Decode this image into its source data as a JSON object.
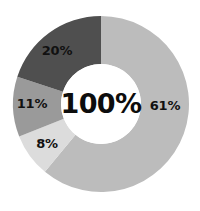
{
  "chart_data": {
    "type": "pie",
    "variant": "donut",
    "title": "",
    "subtitle": "",
    "xlabel": "",
    "ylabel": "",
    "legend": false,
    "legend_position": "none",
    "grid": false,
    "units": "percent",
    "start_angle_deg": 0,
    "direction": "clockwise",
    "total_label": "100%",
    "background_color": "#ffffff",
    "label_color": "#111111",
    "categories": [
      "61%",
      "8%",
      "11%",
      "20%"
    ],
    "values": [
      61,
      8,
      11,
      20
    ],
    "colors": [
      "#bcbcbc",
      "#dcdcdc",
      "#9a9a9a",
      "#4f4f4f"
    ],
    "slices": [
      {
        "label": "61%",
        "value": 61,
        "color": "#bcbcbc",
        "label_x": 165,
        "label_y": 106
      },
      {
        "label": "8%",
        "value": 8,
        "color": "#dcdcdc",
        "label_x": 47,
        "label_y": 144
      },
      {
        "label": "11%",
        "value": 11,
        "color": "#9a9a9a",
        "label_x": 32,
        "label_y": 104
      },
      {
        "label": "20%",
        "value": 20,
        "color": "#4f4f4f",
        "label_x": 57,
        "label_y": 51
      }
    ],
    "geometry": {
      "center_x": 101,
      "center_y": 104,
      "outer_radius": 88,
      "inner_radius": 40
    }
  }
}
